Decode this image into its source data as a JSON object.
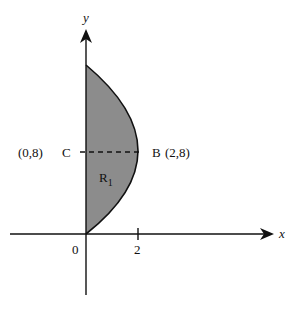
{
  "diagram": {
    "axes": {
      "x_label": "x",
      "y_label": "y",
      "origin_label": "0",
      "x_tick_label": "2"
    },
    "points": {
      "C": {
        "label": "C",
        "coords": "(0,8)"
      },
      "B": {
        "label": "B",
        "coords": "(2,8)"
      }
    },
    "region": {
      "label": "R",
      "subscript": "1"
    },
    "colors": {
      "region_fill": "#8c8c8c",
      "line": "#111111"
    }
  }
}
